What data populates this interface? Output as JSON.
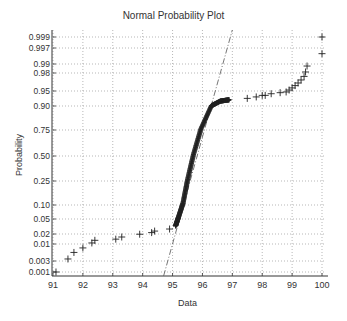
{
  "chart_data": {
    "type": "scatter",
    "title": "Normal Probability Plot",
    "xlabel": "Data",
    "ylabel": "Probability",
    "xlim": [
      91,
      100
    ],
    "x_ticks": [
      91,
      92,
      93,
      94,
      95,
      96,
      97,
      98,
      99,
      100
    ],
    "y_scale": "normal-probability",
    "y_ticks": [
      "0.001",
      "0.003",
      "0.01",
      "0.02",
      "0.05",
      "0.10",
      "0.25",
      "0.50",
      "0.75",
      "0.90",
      "0.95",
      "0.98",
      "0.99",
      "0.997",
      "0.999"
    ],
    "grid": true,
    "marker": "+",
    "marker_color": "#222222",
    "reference_line": {
      "style": "dash-dot",
      "color": "#555555",
      "from": {
        "x": 94.7,
        "p": 0.0005
      },
      "to": {
        "x": 97.0,
        "p": 0.9995
      }
    },
    "series": [
      {
        "name": "lower_tail",
        "points": [
          {
            "x": 91.1,
            "p": 0.001
          },
          {
            "x": 91.5,
            "p": 0.003
          },
          {
            "x": 91.7,
            "p": 0.005
          },
          {
            "x": 92.0,
            "p": 0.007
          },
          {
            "x": 92.3,
            "p": 0.01
          },
          {
            "x": 92.4,
            "p": 0.012
          },
          {
            "x": 93.1,
            "p": 0.013
          },
          {
            "x": 93.3,
            "p": 0.015
          },
          {
            "x": 93.9,
            "p": 0.018
          },
          {
            "x": 94.3,
            "p": 0.02
          },
          {
            "x": 94.4,
            "p": 0.022
          },
          {
            "x": 94.9,
            "p": 0.025
          }
        ]
      },
      {
        "name": "bulk_s_curve",
        "points": [
          {
            "x": 95.1,
            "p": 0.03
          },
          {
            "x": 95.2,
            "p": 0.05
          },
          {
            "x": 95.35,
            "p": 0.1
          },
          {
            "x": 95.5,
            "p": 0.25
          },
          {
            "x": 95.7,
            "p": 0.5
          },
          {
            "x": 95.95,
            "p": 0.75
          },
          {
            "x": 96.3,
            "p": 0.9
          },
          {
            "x": 96.6,
            "p": 0.92
          },
          {
            "x": 96.9,
            "p": 0.925
          }
        ]
      },
      {
        "name": "upper_tail",
        "points": [
          {
            "x": 97.5,
            "p": 0.93
          },
          {
            "x": 97.8,
            "p": 0.935
          },
          {
            "x": 98.0,
            "p": 0.94
          },
          {
            "x": 98.1,
            "p": 0.94
          },
          {
            "x": 98.3,
            "p": 0.945
          },
          {
            "x": 98.6,
            "p": 0.948
          },
          {
            "x": 98.8,
            "p": 0.95
          },
          {
            "x": 98.9,
            "p": 0.955
          },
          {
            "x": 99.0,
            "p": 0.96
          },
          {
            "x": 99.1,
            "p": 0.965
          },
          {
            "x": 99.2,
            "p": 0.97
          },
          {
            "x": 99.3,
            "p": 0.975
          },
          {
            "x": 99.4,
            "p": 0.98
          },
          {
            "x": 99.45,
            "p": 0.985
          },
          {
            "x": 99.5,
            "p": 0.99
          },
          {
            "x": 100.0,
            "p": 0.996
          },
          {
            "x": 100.0,
            "p": 0.999
          }
        ]
      }
    ]
  },
  "layout": {
    "plot_left": 53,
    "plot_right": 322,
    "plot_bottom": 276,
    "plot_top": 30,
    "y_tick_px": {
      "0.001": 272,
      "0.003": 261,
      "0.01": 244,
      "0.02": 234,
      "0.05": 219,
      "0.10": 205,
      "0.25": 181,
      "0.50": 156,
      "0.75": 130,
      "0.90": 106,
      "0.95": 91,
      "0.98": 73,
      "0.99": 64,
      "0.997": 48,
      "0.999": 37
    },
    "colors": {
      "axis": "#333333",
      "grid": "#999999",
      "marker": "#222222",
      "refline": "#666666",
      "text": "#333333"
    }
  }
}
